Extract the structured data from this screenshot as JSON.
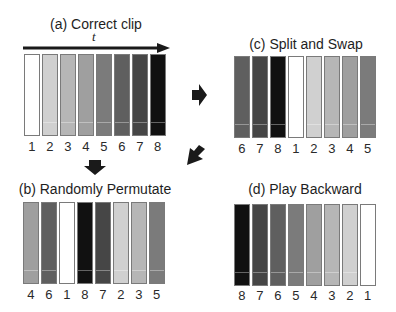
{
  "colors": {
    "frame_shades": {
      "1": "#ffffff",
      "2": "#d0d0d0",
      "3": "#b6b6b6",
      "4": "#9f9f9f",
      "5": "#7b7b7b",
      "6": "#5f5f5f",
      "7": "#464646",
      "8": "#111111"
    },
    "arrow": "#1a1a1a"
  },
  "time_axis": {
    "label": "t"
  },
  "panels": {
    "a": {
      "title": "(a) Correct clip",
      "order": [
        "1",
        "2",
        "3",
        "4",
        "5",
        "6",
        "7",
        "8"
      ]
    },
    "b": {
      "title": "(b) Randomly Permutate",
      "order": [
        "4",
        "6",
        "1",
        "8",
        "7",
        "2",
        "3",
        "5"
      ]
    },
    "c": {
      "title": "(c) Split and Swap",
      "order": [
        "6",
        "7",
        "8",
        "1",
        "2",
        "3",
        "4",
        "5"
      ]
    },
    "d": {
      "title": "(d) Play Backward",
      "order": [
        "8",
        "7",
        "6",
        "5",
        "4",
        "3",
        "2",
        "1"
      ]
    }
  },
  "flow_arrows": [
    {
      "from": "a",
      "to": "b",
      "direction": "down"
    },
    {
      "from": "a",
      "to": "c",
      "direction": "right"
    },
    {
      "from": "a",
      "to": "d",
      "direction": "down-left"
    }
  ]
}
